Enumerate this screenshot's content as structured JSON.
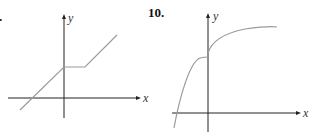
{
  "problems": [
    {
      "number": ".",
      "axes": {
        "x_label": "x",
        "y_label": "y"
      },
      "description": "Piecewise linear: rising line crossing x-axis at negative x, flat segment starting at y-intercept, then rising line"
    },
    {
      "number": "10.",
      "axes": {
        "x_label": "x",
        "y_label": "y"
      },
      "description": "Concave-down increasing curve with a jump discontinuity at x=0, left piece approaching a value below the right piece's start"
    }
  ],
  "colors": {
    "axis": "#222222",
    "curve": "#9a9a9a",
    "background": "#ffffff"
  }
}
